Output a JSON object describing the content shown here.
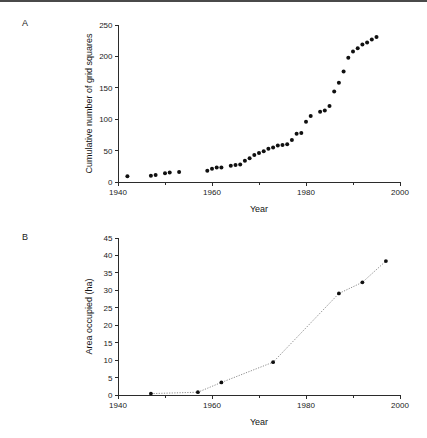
{
  "figure": {
    "panels": [
      {
        "id": "A",
        "label": "A"
      },
      {
        "id": "B",
        "label": "B"
      }
    ]
  },
  "chart_data": [
    {
      "type": "scatter",
      "panel": "A",
      "title": "",
      "xlabel": "Year",
      "ylabel": "Cumulative number of grid squares",
      "xlim": [
        1940,
        2000
      ],
      "ylim": [
        0,
        250
      ],
      "xticks": [
        1940,
        1960,
        1980,
        2000
      ],
      "xticklabels": [
        "1940",
        "1960",
        "1980",
        "2000"
      ],
      "xminorticks": [
        1950,
        1970,
        1990
      ],
      "yticks": [
        0,
        50,
        100,
        150,
        200,
        250
      ],
      "yticklabels": [
        "0",
        "50",
        "100",
        "150",
        "200",
        "250"
      ],
      "grid": false,
      "legend": "none",
      "marker": "filled-circle",
      "connected": false,
      "x": [
        1942,
        1947,
        1948,
        1950,
        1951,
        1953,
        1959,
        1960,
        1961,
        1962,
        1964,
        1965,
        1966,
        1967,
        1968,
        1969,
        1970,
        1971,
        1972,
        1973,
        1974,
        1975,
        1976,
        1977,
        1978,
        1979,
        1980,
        1981,
        1983,
        1984,
        1985,
        1986,
        1987,
        1988,
        1989,
        1990,
        1991,
        1992,
        1993,
        1994,
        1995
      ],
      "y": [
        9,
        10,
        11,
        14,
        15,
        16,
        18,
        21,
        23,
        23,
        26,
        27,
        28,
        34,
        38,
        43,
        46,
        49,
        53,
        55,
        58,
        59,
        60,
        67,
        77,
        78,
        96,
        105,
        112,
        114,
        121,
        144,
        158,
        176,
        198,
        208,
        213,
        219,
        222,
        227,
        231
      ]
    },
    {
      "type": "line",
      "panel": "B",
      "title": "",
      "xlabel": "Year",
      "ylabel": "Area occupied (ha)",
      "xlim": [
        1940,
        2000
      ],
      "ylim": [
        0,
        45
      ],
      "xticks": [
        1940,
        1960,
        1980,
        2000
      ],
      "xticklabels": [
        "1940",
        "1960",
        "1980",
        "2000"
      ],
      "xminorticks": [
        1950,
        1970,
        1990
      ],
      "yticks": [
        0,
        5,
        10,
        15,
        20,
        25,
        30,
        35,
        40,
        45
      ],
      "yticklabels": [
        "0",
        "5",
        "10",
        "15",
        "20",
        "25",
        "30",
        "35",
        "40",
        "45"
      ],
      "grid": false,
      "legend": "none",
      "marker": "filled-circle",
      "connected": true,
      "linestyle": "dotted",
      "x": [
        1947,
        1957,
        1962,
        1973,
        1987,
        1992,
        1997
      ],
      "y": [
        0.4,
        0.8,
        3.6,
        9.4,
        29.1,
        32.3,
        38.4
      ]
    }
  ]
}
